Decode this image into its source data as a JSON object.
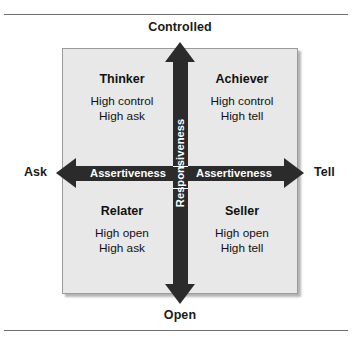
{
  "figure": {
    "name": "assertiveness-responsiveness-matrix",
    "axes": {
      "vertical": {
        "label": "Responsiveness",
        "top_end_label": "Controlled",
        "bottom_end_label": "Open"
      },
      "horizontal": {
        "label_left": "Assertiveness",
        "label_right": "Assertiveness",
        "left_end_label": "Ask",
        "right_end_label": "Tell"
      }
    },
    "quadrants": [
      {
        "id": "thinker",
        "position": "top-left",
        "title": "Thinker",
        "line1": "High control",
        "line2": "High ask"
      },
      {
        "id": "achiever",
        "position": "top-right",
        "title": "Achiever",
        "line1": "High control",
        "line2": "High tell"
      },
      {
        "id": "relater",
        "position": "bottom-left",
        "title": "Relater",
        "line1": "High open",
        "line2": "High ask"
      },
      {
        "id": "seller",
        "position": "bottom-right",
        "title": "Seller",
        "line1": "High open",
        "line2": "High tell"
      }
    ],
    "colors": {
      "arrow": "#2b2b2b",
      "panel_background": "#e8e8e8",
      "panel_border": "#9a9a9a",
      "arrow_text": "#ffffff",
      "body_text": "#111111",
      "rule": "#6e6e6e"
    }
  }
}
